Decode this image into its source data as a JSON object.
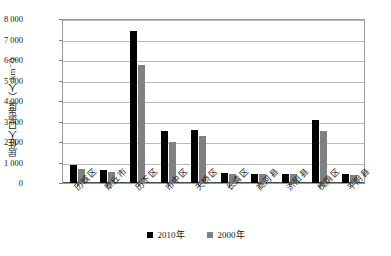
{
  "chart_data": {
    "type": "bar",
    "title": "",
    "xlabel": "",
    "ylabel": "居住人口密度/（人·km⁻²）",
    "ylim": [
      0,
      8000
    ],
    "ytick_values": [
      0,
      1000,
      2000,
      3000,
      4000,
      5000,
      6000,
      7000,
      8000
    ],
    "ytick_labels": [
      "0",
      "1 000",
      "2 000",
      "3 000",
      "4 000",
      "5 000",
      "6 000",
      "7 000",
      "8 000"
    ],
    "grid": true,
    "legend_position": "bottom-center",
    "categories": [
      "历城区",
      "章丘市",
      "历下区",
      "市中区",
      "天桥区",
      "长清区",
      "商河县",
      "济阳县",
      "槐荫区",
      "平阴县"
    ],
    "series": [
      {
        "name": "2010年",
        "color": "#000000",
        "values": [
          880,
          640,
          7420,
          2520,
          2610,
          470,
          460,
          450,
          3080,
          430
        ]
      },
      {
        "name": "2000年",
        "color": "#808080",
        "values": [
          690,
          540,
          5750,
          2000,
          2270,
          420,
          455,
          450,
          2560,
          380
        ]
      }
    ]
  },
  "legend": {
    "items": [
      {
        "label": "2010年",
        "marker": "black-square-marker"
      },
      {
        "label": "2000年",
        "marker": "gray-square-marker"
      }
    ]
  }
}
